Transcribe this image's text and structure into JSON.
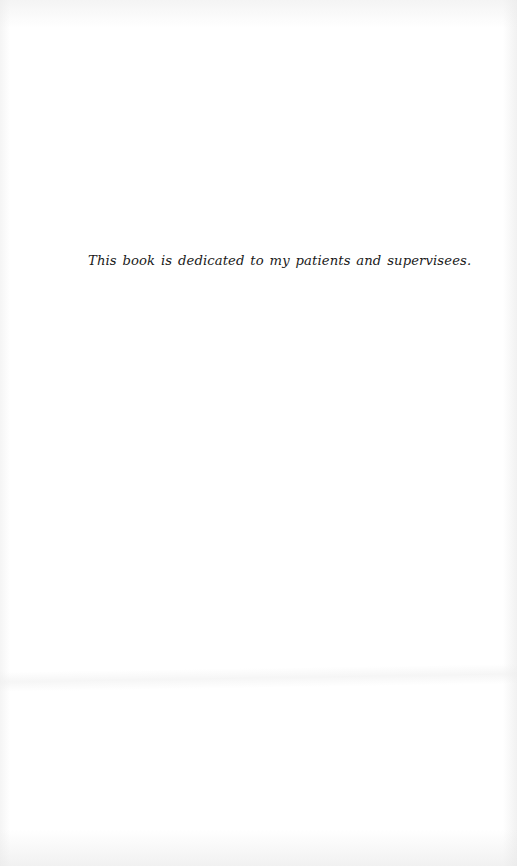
{
  "page": {
    "dedication": "This book is dedicated to my patients and supervisees."
  }
}
